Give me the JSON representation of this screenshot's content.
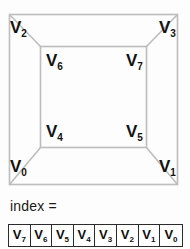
{
  "diagram": {
    "line_color": "#bdbdbd",
    "label_color": "#121212",
    "background": "#fdfdfd",
    "outer_square": {
      "x": 9,
      "y": 14,
      "width": 169,
      "height": 171
    },
    "inner_square": {
      "x": 40,
      "y": 46,
      "width": 107,
      "height": 102
    },
    "vertices": [
      {
        "id": "v0",
        "base": "V",
        "sub": "0",
        "corner": "outer-bottom-left",
        "x": 10,
        "y": 158
      },
      {
        "id": "v1",
        "base": "V",
        "sub": "1",
        "corner": "outer-bottom-right",
        "x": 159,
        "y": 158
      },
      {
        "id": "v2",
        "base": "V",
        "sub": "2",
        "corner": "outer-top-left",
        "x": 10,
        "y": 19
      },
      {
        "id": "v3",
        "base": "V",
        "sub": "3",
        "corner": "outer-top-right",
        "x": 159,
        "y": 19
      },
      {
        "id": "v4",
        "base": "V",
        "sub": "4",
        "corner": "inner-bottom-left",
        "x": 46,
        "y": 123
      },
      {
        "id": "v5",
        "base": "V",
        "sub": "5",
        "corner": "inner-bottom-right",
        "x": 126,
        "y": 123
      },
      {
        "id": "v6",
        "base": "V",
        "sub": "6",
        "corner": "inner-top-left",
        "x": 46,
        "y": 52
      },
      {
        "id": "v7",
        "base": "V",
        "sub": "7",
        "corner": "inner-top-right",
        "x": 126,
        "y": 52
      }
    ]
  },
  "index_section": {
    "label": "index =",
    "cells": [
      {
        "base": "V",
        "sub": "7"
      },
      {
        "base": "V",
        "sub": "6"
      },
      {
        "base": "V",
        "sub": "5"
      },
      {
        "base": "V",
        "sub": "4"
      },
      {
        "base": "V",
        "sub": "3"
      },
      {
        "base": "V",
        "sub": "2"
      },
      {
        "base": "V",
        "sub": "1"
      },
      {
        "base": "V",
        "sub": "0"
      }
    ]
  }
}
